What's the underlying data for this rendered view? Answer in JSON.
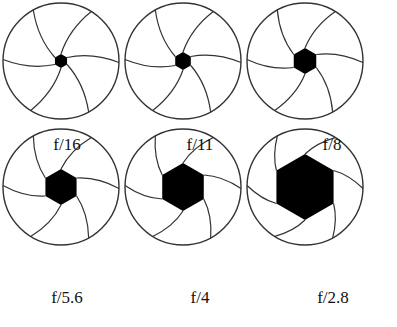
{
  "diagram": {
    "stroke_color": "#333333",
    "fill_color": "#000000",
    "apertures": [
      {
        "label": "f/16",
        "cx": 67,
        "cy": 75,
        "r": 58,
        "hole": 7
      },
      {
        "label": "f/11",
        "cx": 200,
        "cy": 75,
        "r": 58,
        "hole": 9
      },
      {
        "label": "f/8",
        "cx": 332,
        "cy": 75,
        "r": 58,
        "hole": 13
      },
      {
        "label": "f/5.6",
        "cx": 67,
        "cy": 228,
        "r": 58,
        "hole": 18
      },
      {
        "label": "f/4",
        "cx": 200,
        "cy": 228,
        "r": 58,
        "hole": 24
      },
      {
        "label": "f/2.8",
        "cx": 333,
        "cy": 228,
        "r": 58,
        "hole": 33
      }
    ]
  }
}
